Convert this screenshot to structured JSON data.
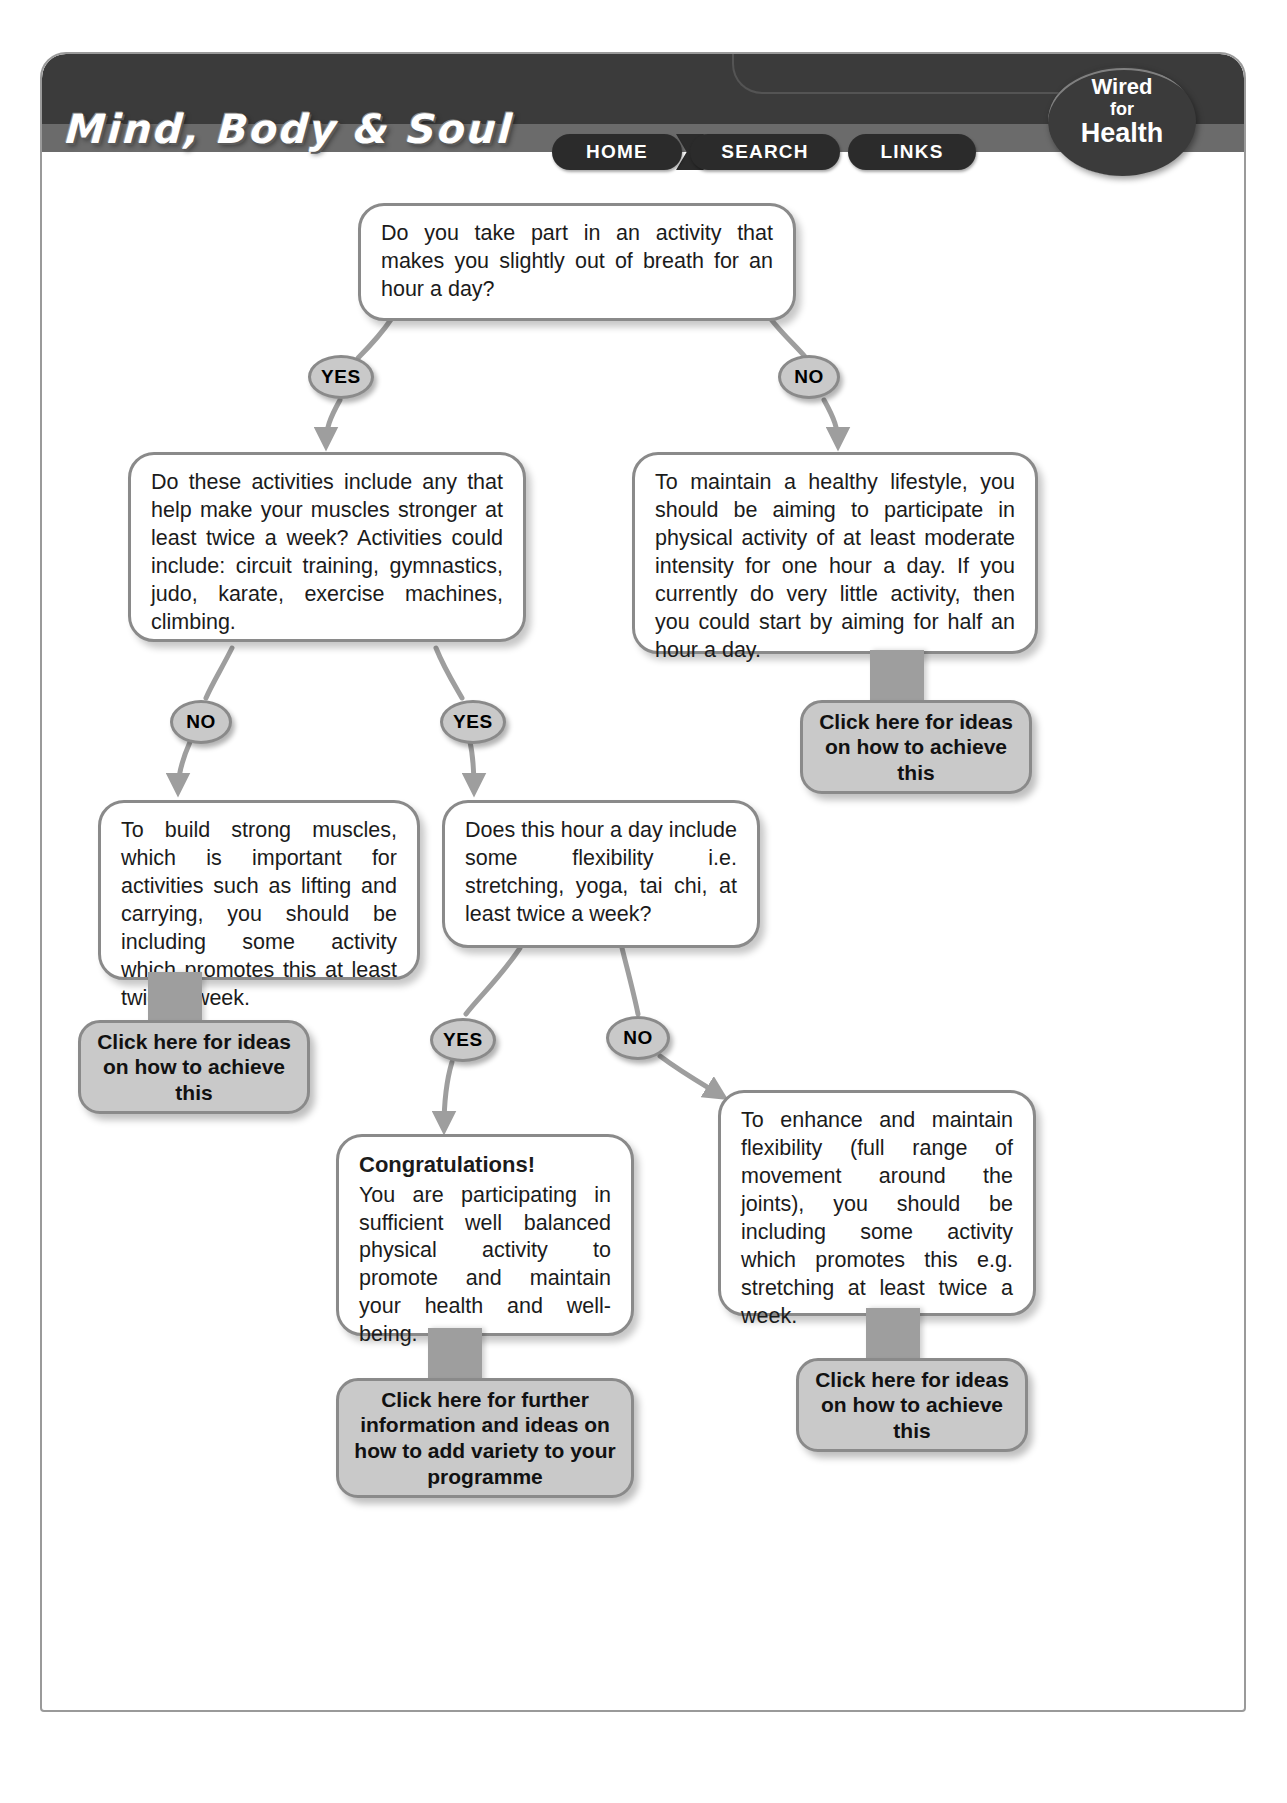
{
  "header": {
    "site_title": "Mind, Body & Soul",
    "nav": [
      {
        "label": "HOME"
      },
      {
        "label": "SEARCH"
      },
      {
        "label": "LINKS"
      }
    ],
    "badge": {
      "line1": "Wired",
      "line2": "for",
      "line3": "Health"
    }
  },
  "flow": {
    "q1": {
      "text": "Do you take part in an activity that makes you slightly out of breath for an hour a day?"
    },
    "q1_yes": "YES",
    "q1_no": "NO",
    "q2": {
      "text": "Do these activities include any that help make your muscles stronger at least twice a week? Activities could include: circuit training, gymnastics, judo, karate, exercise machines, climbing."
    },
    "info_maintain": {
      "text": "To maintain a healthy lifestyle, you should be aiming to participate in physical activity of at least moderate intensity for one hour a day. If you currently do very little activity, then you could start by aiming for half an hour a day."
    },
    "btn_maintain": {
      "label": "Click here for ideas on how to achieve this"
    },
    "q2_no": "NO",
    "q2_yes": "YES",
    "info_muscles": {
      "text": "To build strong muscles, which is important for activities such as lifting and carrying, you should be including some activity which promotes this at least twice a week."
    },
    "btn_muscles": {
      "label": "Click here for ideas on how to achieve this"
    },
    "q3": {
      "text": "Does this hour a day include some flexibility i.e. stretching, yoga, tai chi, at least twice a week?"
    },
    "q3_yes": "YES",
    "q3_no": "NO",
    "congrats": {
      "heading": "Congratulations!",
      "text": "You are participating in sufficient well balanced physical activity to promote and maintain your health and well-being."
    },
    "btn_congrats": {
      "label": "Click here for further information and ideas on how to add variety to your programme"
    },
    "info_flexibility": {
      "text": "To enhance and maintain flexibility (full range of movement around the joints), you should be including some activity which promotes this e.g. stretching at least twice a week."
    },
    "btn_flexibility": {
      "label": "Click here for ideas on how to achieve this"
    }
  },
  "colors": {
    "header_dark": "#3b3b3b",
    "header_mid": "#6b6b6b",
    "node_border": "#8a8a8a",
    "button_fill": "#c9c9c9",
    "connector": "#9e9e9e"
  }
}
